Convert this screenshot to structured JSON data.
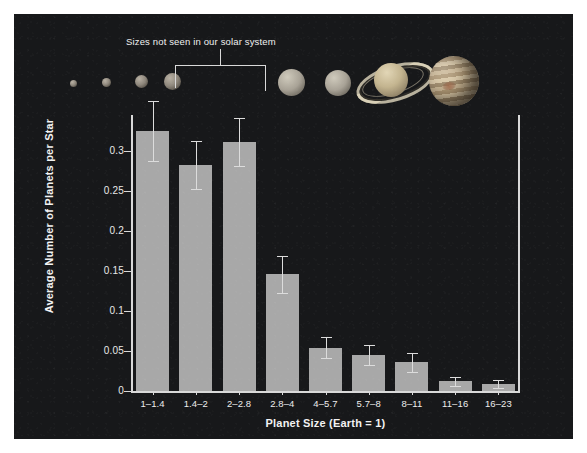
{
  "chart_data": {
    "type": "bar",
    "title": "",
    "xlabel": "Planet Size (Earth = 1)",
    "ylabel": "Average Number of Planets per Star",
    "categories": [
      "1–1.4",
      "1.4–2",
      "2–2.8",
      "2.8–4",
      "4–5.7",
      "5.7–8",
      "8–11",
      "11–16",
      "16–23"
    ],
    "values": [
      0.325,
      0.283,
      0.311,
      0.146,
      0.054,
      0.045,
      0.036,
      0.012,
      0.009
    ],
    "errors_upper": [
      0.038,
      0.03,
      0.03,
      0.023,
      0.013,
      0.013,
      0.012,
      0.006,
      0.005
    ],
    "errors_lower": [
      0.038,
      0.03,
      0.03,
      0.023,
      0.013,
      0.013,
      0.012,
      0.006,
      0.005
    ],
    "ylim": [
      0,
      0.345
    ],
    "yticks": [
      "0",
      "0.05",
      "0.1",
      "0.15",
      "0.2",
      "0.25",
      "0.3"
    ],
    "ytick_values": [
      0,
      0.05,
      0.1,
      0.15,
      0.2,
      0.25,
      0.3
    ],
    "grid": false,
    "legend": "none",
    "bar_color": "#a8a8a8",
    "background_color": "#17181a",
    "axis_color": "#d9d9d9",
    "text_color": "#f0f0f0"
  },
  "annotation": {
    "label": "Sizes not seen in our solar system",
    "spans_categories": [
      "2–2.8",
      "2.8–4"
    ]
  },
  "planets": {
    "caption": "planet size illustration row",
    "items": [
      {
        "name": "rocky-planet-small-1",
        "kind": "rock",
        "diameter_px": 7
      },
      {
        "name": "rocky-planet-small-2",
        "kind": "rock",
        "diameter_px": 9
      },
      {
        "name": "rocky-planet-medium",
        "kind": "rock",
        "diameter_px": 13
      },
      {
        "name": "rocky-planet-large",
        "kind": "rock",
        "diameter_px": 17
      },
      {
        "name": "ice-giant-neptune",
        "kind": "ice",
        "diameter_px": 27
      },
      {
        "name": "ice-giant-uranus",
        "kind": "ice",
        "diameter_px": 26
      },
      {
        "name": "saturn",
        "kind": "saturn",
        "diameter_px": 34
      },
      {
        "name": "jupiter",
        "kind": "jupiter",
        "diameter_px": 50
      }
    ]
  }
}
